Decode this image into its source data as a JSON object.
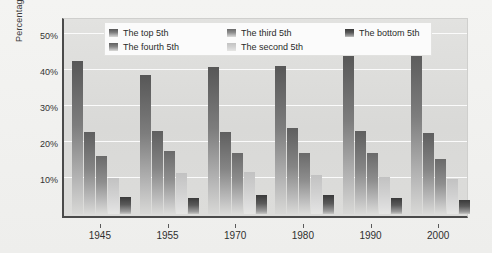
{
  "chart_data": {
    "type": "bar",
    "title": "",
    "xlabel": "",
    "ylabel": "Percentage",
    "categories": [
      "1945",
      "1955",
      "1970",
      "1980",
      "1990",
      "2000"
    ],
    "ylim": [
      0,
      55
    ],
    "yticks": [
      10,
      20,
      30,
      40,
      50
    ],
    "ytick_labels": [
      "10%",
      "20%",
      "30%",
      "40%",
      "50%"
    ],
    "grid": "horizontal",
    "legend_position": "top-center",
    "series": [
      {
        "name": "The top 5th",
        "color": "#6d6d6d",
        "values": [
          42.5,
          38.5,
          40.7,
          41.2,
          44.5,
          47.0
        ]
      },
      {
        "name": "The fourth 5th",
        "color": "#757575",
        "values": [
          22.9,
          23.0,
          22.8,
          23.9,
          23.0,
          22.5
        ]
      },
      {
        "name": "The third 5th",
        "color": "#828282",
        "values": [
          16.1,
          17.5,
          17.0,
          17.0,
          17.0,
          15.2
        ]
      },
      {
        "name": "The second 5th",
        "color": "#cfcfcf",
        "values": [
          10.1,
          11.4,
          11.8,
          10.9,
          10.2,
          9.6
        ]
      },
      {
        "name": "The bottom 5th",
        "color": "#4a4a4a",
        "values": [
          4.6,
          4.5,
          5.3,
          5.2,
          4.4,
          3.9
        ]
      }
    ]
  },
  "legend": {
    "items": [
      {
        "label": "The top 5th",
        "swatch": "legend-swatch-top-5th"
      },
      {
        "label": "The third 5th",
        "swatch": "legend-swatch-third-5th"
      },
      {
        "label": "The bottom 5th",
        "swatch": "legend-swatch-bottom-5th"
      },
      {
        "label": "The fourth 5th",
        "swatch": "legend-swatch-fourth-5th"
      },
      {
        "label": "The second 5th",
        "swatch": "legend-swatch-second-5th"
      }
    ]
  }
}
